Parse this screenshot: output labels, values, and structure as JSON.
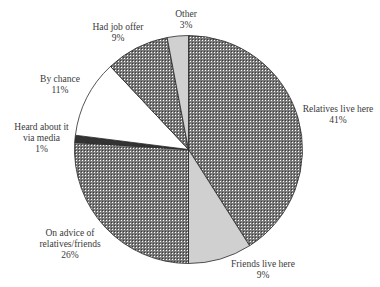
{
  "chart_data": {
    "type": "pie",
    "title": "",
    "start_angle_deg": 0,
    "direction": "clockwise",
    "slices": [
      {
        "label": "Relatives live here",
        "value": 41,
        "value_label": "41%",
        "fill": "crosshatch"
      },
      {
        "label": "Friends live here",
        "value": 9,
        "value_label": "9%",
        "fill": "#d0d0d0"
      },
      {
        "label": "On advice of relatives/friends",
        "value": 26,
        "value_label": "26%",
        "fill": "crosshatch"
      },
      {
        "label": "Heard about it via media",
        "value": 1,
        "value_label": "1%",
        "fill": "#333333"
      },
      {
        "label": "By chance",
        "value": 11,
        "value_label": "11%",
        "fill": "#ffffff"
      },
      {
        "label": "Had job offer",
        "value": 9,
        "value_label": "9%",
        "fill": "crosshatch"
      },
      {
        "label": "Other",
        "value": 3,
        "value_label": "3%",
        "fill": "#d0d0d0"
      }
    ],
    "legend": "none (direct labels)"
  },
  "labels": {
    "relatives": {
      "line1": "Relatives live here",
      "pct": "41%"
    },
    "friends": {
      "line1": "Friends live here",
      "pct": "9%"
    },
    "advice": {
      "line1": "On advice of",
      "line2": "relatives/friends",
      "pct": "26%"
    },
    "media": {
      "line1": "Heard about it",
      "line2": "via media",
      "pct": "1%"
    },
    "chance": {
      "line1": "By chance",
      "pct": "11%"
    },
    "job": {
      "line1": "Had job offer",
      "pct": "9%"
    },
    "other": {
      "line1": "Other",
      "pct": "3%"
    }
  }
}
